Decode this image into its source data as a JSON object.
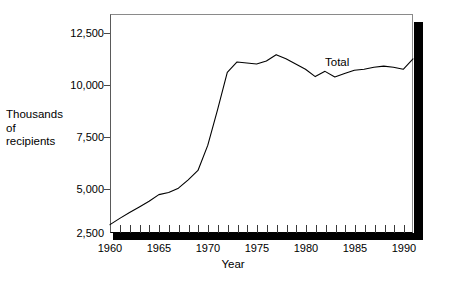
{
  "chart_data": {
    "type": "line",
    "title": "",
    "xlabel": "Year",
    "ylabel": "Thousands of recipients",
    "ylabel_lines": [
      "Thousands",
      "of",
      "recipients"
    ],
    "xlim": [
      1960,
      1991
    ],
    "ylim": [
      2500,
      13000
    ],
    "yticks": [
      2500,
      5000,
      7500,
      10000,
      12500
    ],
    "ytick_labels": [
      "2,500",
      "5,000",
      "7,500",
      "10,000",
      "12,500"
    ],
    "xticks": [
      1960,
      1965,
      1970,
      1975,
      1980,
      1985,
      1990
    ],
    "xtick_labels": [
      "1960",
      "1965",
      "1970",
      "1975",
      "1980",
      "1985",
      "1990"
    ],
    "minor_xtick_interval": 1,
    "grid": false,
    "legend": "annotation",
    "series": [
      {
        "name": "Total",
        "color": "#000000",
        "x": [
          1960,
          1961,
          1962,
          1963,
          1964,
          1965,
          1966,
          1967,
          1968,
          1969,
          1970,
          1971,
          1972,
          1973,
          1974,
          1975,
          1976,
          1977,
          1978,
          1979,
          1980,
          1981,
          1982,
          1983,
          1984,
          1985,
          1986,
          1987,
          1988,
          1989,
          1990,
          1991
        ],
        "values": [
          2900,
          3200,
          3480,
          3750,
          4020,
          4340,
          4440,
          4650,
          5050,
          5500,
          6700,
          8400,
          10200,
          10700,
          10650,
          10600,
          10750,
          11050,
          10850,
          10600,
          10350,
          10000,
          10250,
          9980,
          10150,
          10300,
          10350,
          10450,
          10500,
          10450,
          10350,
          10850
        ]
      }
    ],
    "annotations": [
      {
        "text": "Total",
        "x": 1986,
        "y": 11500
      }
    ]
  },
  "axes": {
    "y_title_lines": [
      "Thousands",
      "of",
      "recipients"
    ],
    "x_title": "Year"
  }
}
